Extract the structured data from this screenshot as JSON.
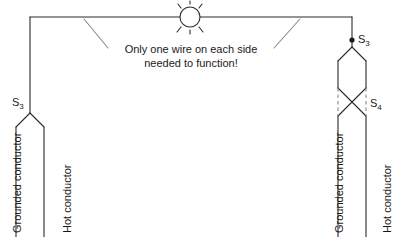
{
  "diagram": {
    "callout": {
      "line1": "Only one wire on each side",
      "line2": "needed to function!"
    },
    "labels": {
      "left_switch_s3": "S",
      "left_switch_s3_sub": "3",
      "right_switch_s3": "S",
      "right_switch_s3_sub": "3",
      "right_switch_s4": "S",
      "right_switch_s4_sub": "4",
      "left_grounded": "Grounded conductor",
      "left_hot": "Hot conductor",
      "right_grounded": "Grounded conductor",
      "right_hot": "Hot conductor"
    },
    "symbols": {
      "lamp": "lamp-symbol",
      "junction": "junction-dot",
      "three_way_switch": "three-way-switch-symbol",
      "four_way_switch": "four-way-switch-symbol"
    },
    "colors": {
      "wire": "#2b2b2b",
      "dashed_wire": "#8a8a8a",
      "background": "#ffffff",
      "text": "#1a1a1a"
    }
  }
}
